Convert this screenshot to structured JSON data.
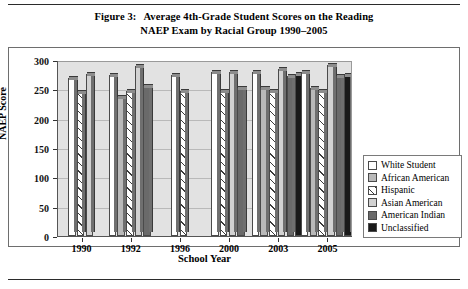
{
  "figure": {
    "label": "Figure 3:",
    "title_line1": "Average 4th-Grade Student Scores on the Reading",
    "title_line2": "NAEP Exam by Racial Group 1990–2005"
  },
  "legend": {
    "position": "right",
    "items": [
      {
        "label": "White Student",
        "key": "white",
        "style": "f-white",
        "color": "#ffffff"
      },
      {
        "label": "African American",
        "key": "african",
        "style": "f-african",
        "color": "#b9b9b9"
      },
      {
        "label": "Hispanic",
        "key": "hispanic",
        "style": "f-hispanic",
        "color": "#ffffff"
      },
      {
        "label": "Asian American",
        "key": "asian",
        "style": "f-asian",
        "color": "#d2d2d2"
      },
      {
        "label": "American Indian",
        "key": "amind",
        "style": "f-amind",
        "color": "#6a6a6a"
      },
      {
        "label": "Unclassified",
        "key": "unclass",
        "style": "f-unclass",
        "color": "#1a1a1a"
      }
    ]
  },
  "axes": {
    "ylabel": "NAEP Score",
    "xlabel": "School Year",
    "yticks": [
      0,
      50,
      100,
      150,
      200,
      250,
      300
    ],
    "ylim": [
      0,
      300
    ],
    "xticks": [
      "1990",
      "1992",
      "1996",
      "2000",
      "2003",
      "2005"
    ],
    "grid": true
  },
  "chart_data": {
    "type": "bar",
    "title": "Average 4th-Grade Student Scores on the Reading NAEP Exam by Racial Group 1990–2005",
    "xlabel": "School Year",
    "ylabel": "NAEP Score",
    "ylim": [
      0,
      300
    ],
    "categories": [
      "1990",
      "1992",
      "1996",
      "2000",
      "2003",
      "2005"
    ],
    "series": [
      {
        "name": "White Student",
        "values": [
          270,
          275,
          275,
          280,
          280,
          280
        ]
      },
      {
        "name": "African American",
        "values": [
          null,
          237,
          null,
          null,
          252,
          253
        ]
      },
      {
        "name": "Hispanic",
        "values": [
          245,
          248,
          248,
          248,
          248,
          248
        ]
      },
      {
        "name": "Asian American",
        "values": [
          277,
          290,
          null,
          280,
          285,
          292
        ]
      },
      {
        "name": "American Indian",
        "values": [
          null,
          256,
          null,
          253,
          272,
          273
        ]
      },
      {
        "name": "Unclassified",
        "values": [
          null,
          null,
          null,
          null,
          277,
          275
        ]
      }
    ]
  }
}
